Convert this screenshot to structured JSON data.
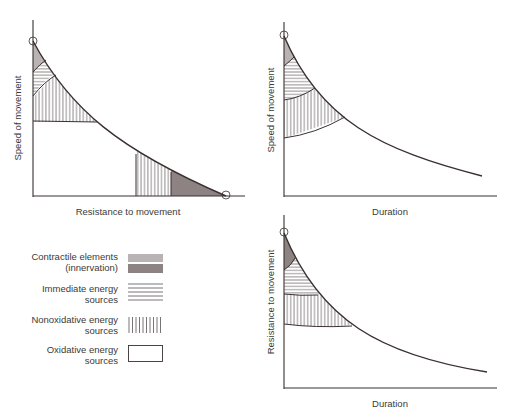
{
  "colors": {
    "line": "#3a3030",
    "contractile_light": "#b9b3b3",
    "contractile_dark": "#8d8383",
    "hatch": "#555050",
    "background": "#ffffff"
  },
  "charts": {
    "speed_vs_resistance": {
      "xlabel": "Resistance to movement",
      "ylabel": "Speed of movement"
    },
    "speed_vs_duration": {
      "xlabel": "Duration",
      "ylabel": "Speed of movement"
    },
    "resistance_vs_duration": {
      "xlabel": "Duration",
      "ylabel": "Resistance to movement"
    }
  },
  "legend": {
    "items": [
      {
        "line1": "Contractile elements",
        "line2": "(innervation)",
        "pattern": "gray-fill"
      },
      {
        "line1": "Immediate energy",
        "line2": "sources",
        "pattern": "horizontal-lines"
      },
      {
        "line1": "Nonoxidative energy",
        "line2": "sources",
        "pattern": "vertical-lines"
      },
      {
        "line1": "Oxidative energy",
        "line2": "sources",
        "pattern": "empty"
      }
    ]
  }
}
